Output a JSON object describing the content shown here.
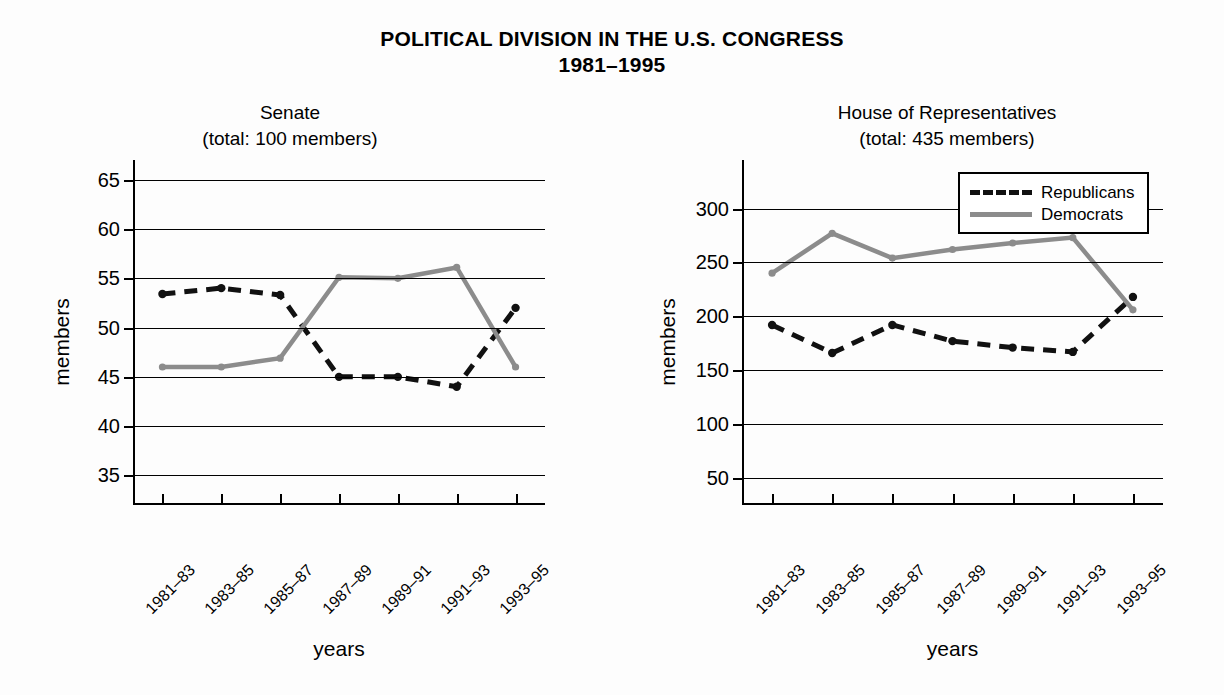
{
  "title": {
    "line1": "POLITICAL DIVISION IN  THE U.S. CONGRESS",
    "line2": "1981–1995"
  },
  "legend": {
    "position": "top-right of house panel",
    "entries": [
      {
        "label": "Republicans",
        "style": "dashed",
        "color": "#111111"
      },
      {
        "label": "Democrats",
        "style": "solid",
        "color": "#8c8c8c"
      }
    ]
  },
  "colors": {
    "republicans": "#111111",
    "democrats": "#8c8c8c",
    "axis": "#000000",
    "background": "#fdfdfd"
  },
  "chart_data": [
    {
      "type": "line",
      "title": "Senate",
      "subtitle": "(total: 100 members)",
      "xlabel": "years",
      "ylabel": "members",
      "categories": [
        "1981–83",
        "1983–85",
        "1985–87",
        "1987–89",
        "1989–91",
        "1991–93",
        "1993–95"
      ],
      "yticks": [
        35,
        40,
        45,
        50,
        55,
        60,
        65
      ],
      "ylim": [
        32,
        67
      ],
      "grid": true,
      "legend_position": "none",
      "series": [
        {
          "name": "Republicans",
          "style": "dashed",
          "color": "#111111",
          "values": [
            53.4,
            54.0,
            53.3,
            45.0,
            45.0,
            44.0,
            52.0
          ]
        },
        {
          "name": "Democrats",
          "style": "solid",
          "color": "#8c8c8c",
          "values": [
            46.0,
            46.0,
            46.9,
            55.1,
            55.0,
            56.1,
            46.0
          ]
        }
      ]
    },
    {
      "type": "line",
      "title": "House of Representatives",
      "subtitle": "(total: 435 members)",
      "xlabel": "years",
      "ylabel": "members",
      "categories": [
        "1981–83",
        "1983–85",
        "1985–87",
        "1987–89",
        "1989–91",
        "1991–93",
        "1993–95"
      ],
      "yticks": [
        50,
        100,
        150,
        200,
        250,
        300
      ],
      "ylim": [
        25,
        345
      ],
      "grid": true,
      "legend_position": "top-right",
      "series": [
        {
          "name": "Republicans",
          "style": "dashed",
          "color": "#111111",
          "values": [
            192,
            166,
            192,
            177,
            171,
            167,
            218
          ]
        },
        {
          "name": "Democrats",
          "style": "solid",
          "color": "#8c8c8c",
          "values": [
            240,
            277,
            254,
            262,
            268,
            273,
            206
          ]
        }
      ]
    }
  ]
}
